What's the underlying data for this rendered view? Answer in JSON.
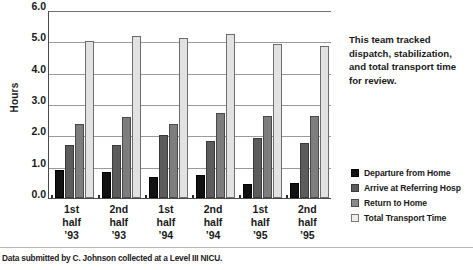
{
  "chart_data": {
    "type": "bar",
    "title": "",
    "xlabel": "",
    "ylabel": "Hours",
    "ylim": [
      0,
      6
    ],
    "ytick_step": 1,
    "ytick_labels": [
      "0.0",
      "1.0",
      "2.0",
      "3.0",
      "4.0",
      "5.0",
      "6.0"
    ],
    "grid": true,
    "legend_position": "right",
    "categories": [
      {
        "line1": "1st",
        "line2": "half",
        "line3": "’93"
      },
      {
        "line1": "2nd",
        "line2": "half",
        "line3": "’93"
      },
      {
        "line1": "1st",
        "line2": "half",
        "line3": "’94"
      },
      {
        "line1": "2nd",
        "line2": "half",
        "line3": "’94"
      },
      {
        "line1": "1st",
        "line2": "half",
        "line3": "’95"
      },
      {
        "line1": "2nd",
        "line2": "half",
        "line3": "’95"
      }
    ],
    "category_labels": [
      "1st half '93",
      "2nd half '93",
      "1st half '94",
      "2nd half '94",
      "1st half '95",
      "2nd half '95"
    ],
    "series": [
      {
        "name": "Departure from Home",
        "color": "#111111",
        "values": [
          0.88,
          0.84,
          0.68,
          0.74,
          0.45,
          0.49
        ]
      },
      {
        "name": "Arrive at Referring Hosp",
        "color": "#5c5c5c",
        "values": [
          1.68,
          1.69,
          2.0,
          1.81,
          1.91,
          1.75
        ]
      },
      {
        "name": "Return to Home",
        "color": "#7d7d7d",
        "values": [
          2.37,
          2.59,
          2.37,
          2.7,
          2.62,
          2.62
        ]
      },
      {
        "name": "Total Transport Time",
        "color": "#e2e2e2",
        "values": [
          5.0,
          5.16,
          5.1,
          5.23,
          4.93,
          4.85
        ]
      }
    ]
  },
  "side_note": {
    "lines": [
      "This team tracked",
      "dispatch, stabilization,",
      "and total transport time",
      "for review."
    ]
  },
  "caption": {
    "text": "Data submitted by C. Johnson collected at a Level III NICU."
  },
  "colors": {
    "series_0": "#111111",
    "series_1": "#5c5c5c",
    "series_2": "#7d7d7d",
    "series_3": "#e2e2e2",
    "gridline": "#9a9a9a",
    "axis": "#4a4a4a",
    "background": "#ffffff",
    "text": "#1a1a1a"
  }
}
